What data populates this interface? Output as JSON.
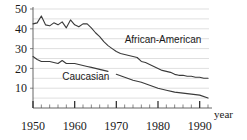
{
  "chart_data": {
    "type": "line",
    "title": "",
    "xlabel": "year",
    "ylabel": "",
    "xlim": [
      1950,
      1992
    ],
    "ylim": [
      0,
      50
    ],
    "grid": true,
    "grid_step": 5,
    "legend_position": "inline-annotation",
    "y_ticks": [
      10,
      20,
      30,
      40,
      50
    ],
    "y_tick_labels": [
      "10",
      "20",
      "30",
      "40",
      "50"
    ],
    "x_ticks": [
      1950,
      1960,
      1970,
      1980,
      1990
    ],
    "x_tick_labels": [
      "1950",
      "1960",
      "1970",
      "1980",
      "1990"
    ],
    "x_minor_tick_step": 2,
    "annotations": [
      {
        "text": "African-American",
        "x": 1972,
        "y": 33
      },
      {
        "text": "Caucasian",
        "x": 1957,
        "y": 14
      }
    ],
    "series": [
      {
        "name": "African-American",
        "label": "African-American",
        "color": "#3a3a3a",
        "x": [
          1950,
          1951,
          1952,
          1953,
          1954,
          1955,
          1956,
          1957,
          1958,
          1959,
          1960,
          1961,
          1962,
          1963,
          1964,
          1965,
          1966,
          1967,
          1968,
          1969,
          1970,
          1971,
          1972,
          1973,
          1974,
          1975,
          1976,
          1977,
          1978,
          1979,
          1980,
          1981,
          1982,
          1983,
          1984,
          1985,
          1986,
          1987,
          1988,
          1989,
          1990,
          1991,
          1992
        ],
        "values": [
          42.5,
          43.0,
          46.5,
          42.0,
          41.5,
          43.0,
          42.0,
          43.5,
          40.5,
          44.5,
          42.0,
          41.0,
          42.5,
          42.5,
          40.5,
          38.0,
          36.0,
          33.5,
          31.5,
          30.0,
          28.5,
          27.5,
          27.0,
          26.5,
          26.0,
          25.5,
          23.5,
          23.0,
          22.0,
          21.0,
          20.0,
          19.0,
          18.5,
          18.0,
          17.0,
          16.5,
          16.5,
          16.0,
          16.0,
          15.5,
          15.5,
          15.0,
          15.0
        ]
      },
      {
        "name": "Caucasian",
        "label": "Caucasian",
        "color": "#3a3a3a",
        "x": [
          1950,
          1951,
          1952,
          1953,
          1954,
          1955,
          1956,
          1957,
          1958,
          1959,
          1960,
          1961,
          1962,
          1963,
          1964,
          1965,
          1966,
          1967,
          1968
        ],
        "values": [
          26.0,
          24.5,
          23.5,
          23.5,
          23.5,
          23.0,
          22.5,
          24.0,
          22.5,
          22.5,
          22.5,
          22.0,
          21.5,
          21.0,
          20.5,
          20.0,
          19.5,
          19.0,
          18.5
        ],
        "segment2_x": [
          1970,
          1972,
          1974,
          1976,
          1978,
          1980,
          1982,
          1984,
          1986,
          1988,
          1990,
          1992
        ],
        "segment2_values": [
          17.0,
          15.5,
          14.0,
          13.0,
          11.5,
          10.0,
          9.0,
          8.0,
          7.5,
          7.0,
          6.5,
          5.0
        ]
      }
    ]
  }
}
